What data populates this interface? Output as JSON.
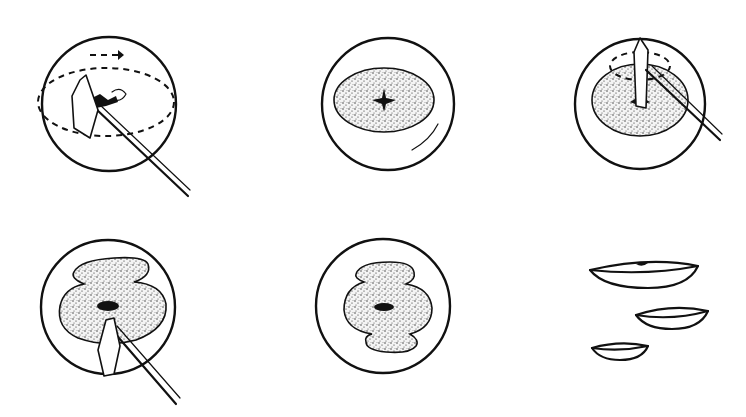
{
  "figure": {
    "title": "",
    "panels": [
      {
        "id": 1,
        "description": "Instrument rotating within lens, dashed circular path with arrow",
        "icons": [
          "arrow-right-dashed",
          "instrument"
        ]
      },
      {
        "id": 2,
        "description": "Lens with stippled central opening and small star-shaped hole",
        "icons": []
      },
      {
        "id": 3,
        "description": "Instrument inserted into stippled opening with dashed rotation path",
        "icons": [
          "instrument"
        ]
      },
      {
        "id": 4,
        "description": "Enlarged irregular stippled opening with central hole, instrument at bottom",
        "icons": [
          "instrument"
        ]
      },
      {
        "id": 5,
        "description": "Enlarged irregular stippled opening with central hole",
        "icons": []
      },
      {
        "id": 6,
        "description": "Three separated lens fragments (dishes) in decreasing size",
        "icons": []
      }
    ]
  },
  "colors": {
    "ink": "#111111",
    "background": "#ffffff"
  }
}
